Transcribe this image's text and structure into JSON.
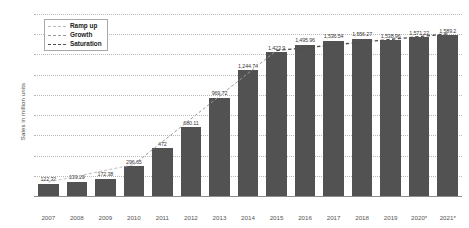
{
  "chart_data": {
    "type": "bar",
    "title": "",
    "xlabel": "",
    "ylabel": "Sales in million units",
    "ylim": [
      0,
      1800
    ],
    "ytick_step": 200,
    "grid": true,
    "legend_position": "top-left",
    "categories": [
      "2007",
      "2008",
      "2009",
      "2010",
      "2011",
      "2012",
      "2013",
      "2014",
      "2015",
      "2016",
      "2017",
      "2018",
      "2019",
      "2020*",
      "2021*"
    ],
    "values": [
      122.32,
      139.29,
      172.38,
      296.65,
      472,
      680.11,
      969.72,
      1244.74,
      1423.9,
      1495.96,
      1536.54,
      1556.27,
      1538.96,
      1571.22,
      1589.2
    ],
    "value_labels": [
      "122.32",
      "139.29",
      "172.38",
      "296.65",
      "472",
      "680.11",
      "969.72",
      "1,244.74",
      "1,423.9",
      "1,495.96",
      "1,536.54",
      "1,556.27",
      "1,538.96",
      "1,571.22",
      "1,589.2"
    ],
    "ytick_labels": [
      "0",
      "200",
      "400",
      "600",
      "800",
      "1,000",
      "1,200",
      "1,400",
      "1,600",
      "1,800"
    ],
    "series_color": "#525252",
    "legend": [
      {
        "label": "Ramp up",
        "color": "#bdbdbd",
        "style": "dashed"
      },
      {
        "label": "Growth",
        "color": "#9a9a9a",
        "style": "dashed"
      },
      {
        "label": "Saturation",
        "color": "#4f4f4f",
        "style": "dashed"
      }
    ]
  }
}
